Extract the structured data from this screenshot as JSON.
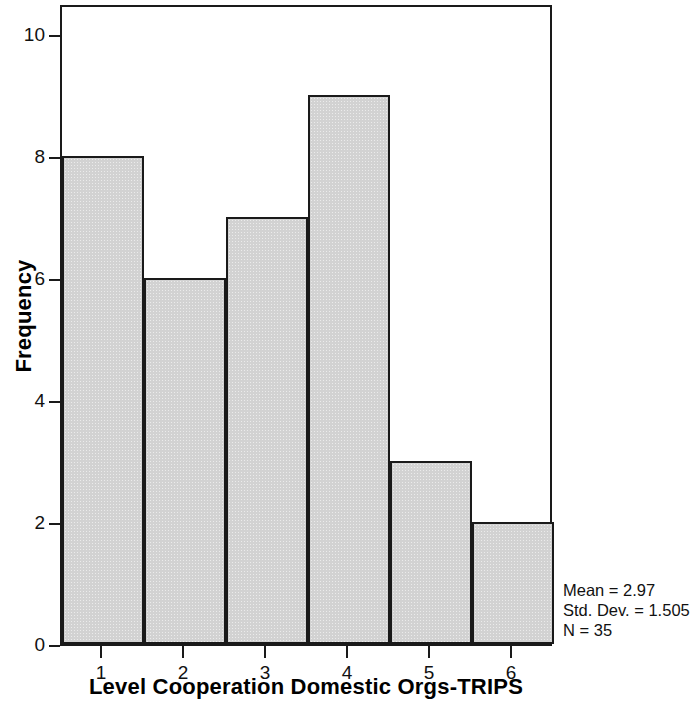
{
  "chart_data": {
    "type": "bar",
    "title": "",
    "subtitle": "",
    "xlabel": "Level Cooperation Domestic Orgs-TRIPS",
    "ylabel": "Frequency",
    "categories": [
      "1",
      "2",
      "3",
      "4",
      "5",
      "6"
    ],
    "values": [
      8,
      6,
      7,
      9,
      3,
      2
    ],
    "series": [
      {
        "name": "Frequency",
        "values": [
          8,
          6,
          7,
          9,
          3,
          2
        ]
      }
    ],
    "xlim": [
      0.5,
      6.5
    ],
    "ylim": [
      0,
      10.5
    ],
    "y_ticks": [
      0,
      2,
      4,
      6,
      8,
      10
    ],
    "y_tick_labels": [
      "0",
      "2",
      "4",
      "6",
      "8",
      "10"
    ],
    "x_ticks": [
      1,
      2,
      3,
      4,
      5,
      6
    ],
    "x_tick_labels": [
      "1",
      "2",
      "3",
      "4",
      "5",
      "6"
    ],
    "grid": false,
    "legend": false,
    "legend_position": "none",
    "bar_gap": 0,
    "colors": {
      "bar_fill": "#d2d2d2",
      "bar_edge": "#1a1a1a",
      "axis": "#1a1a1a",
      "text": "#111111",
      "background": "#ffffff"
    },
    "annotations": [
      {
        "id": "mean",
        "text": "Mean = 2.97"
      },
      {
        "id": "std_dev",
        "text": "Std. Dev. = 1.505"
      },
      {
        "id": "n",
        "text": "N = 35"
      }
    ]
  },
  "statistics": {
    "mean_line": "Mean = 2.97",
    "std_dev_line": "Std. Dev. = 1.505",
    "n_line": "N = 35",
    "mean": 2.97,
    "std_dev": 1.505,
    "n": 35
  }
}
